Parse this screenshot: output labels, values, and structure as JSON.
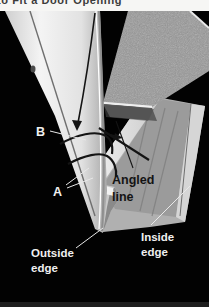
{
  "page": {
    "title": "to Fit a Door Opening"
  },
  "figure": {
    "labels": {
      "b": "B",
      "a": "A",
      "angled_line": [
        "Angled",
        "line"
      ],
      "outside_edge": [
        "Outside",
        "edge"
      ],
      "inside_edge": [
        "Inside",
        "edge"
      ]
    },
    "colors": {
      "photo_background": "#020202",
      "title_background": "#f6f6f4",
      "title_text": "#3c3c3c",
      "label_text": "#f0f0f0",
      "pencil_mark": "#141414",
      "door_jamb": "#e9e9e9",
      "particle_board": "#9a9a9a",
      "metal_track": "#c7c7c7"
    }
  }
}
